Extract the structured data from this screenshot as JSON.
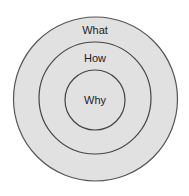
{
  "diagram": {
    "type": "concentric-circles",
    "fill_color": "#e1e1e1",
    "stroke_color": "#555555",
    "circles": [
      {
        "label": "What",
        "cx": 95.5,
        "cy": 99,
        "r": 82,
        "label_y": 34
      },
      {
        "label": "How",
        "cx": 95,
        "cy": 98,
        "r": 56,
        "label_y": 62
      },
      {
        "label": "Why",
        "cx": 95,
        "cy": 100,
        "r": 30,
        "label_y": 104
      }
    ]
  }
}
